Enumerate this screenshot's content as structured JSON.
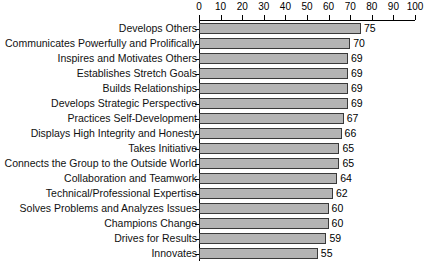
{
  "chart_data": {
    "type": "bar",
    "orientation": "horizontal",
    "title": "",
    "subtitle": "",
    "xlabel": "",
    "ylabel": "",
    "xlim": [
      0,
      100
    ],
    "xticks": [
      0,
      10,
      20,
      30,
      40,
      50,
      60,
      70,
      80,
      90,
      100
    ],
    "grid": false,
    "legend": false,
    "axis_position": "top",
    "bar_color": "#b4b4b4",
    "bar_border_color": "#3a3a3a",
    "show_value_labels": true,
    "categories": [
      "Develops Others",
      "Communicates Powerfully and Prolifically",
      "Inspires and Motivates Others",
      "Establishes Stretch Goals",
      "Builds Relationships",
      "Develops Strategic Perspective",
      "Practices Self-Development",
      "Displays High Integrity and Honesty",
      "Takes Initiative",
      "Connects the Group to the Outside World",
      "Collaboration and Teamwork",
      "Technical/Professional Expertise",
      "Solves Problems and Analyzes Issues",
      "Champions Change",
      "Drives for Results",
      "Innovates"
    ],
    "values": [
      75,
      70,
      69,
      69,
      69,
      69,
      67,
      66,
      65,
      65,
      64,
      62,
      60,
      60,
      59,
      55
    ]
  }
}
